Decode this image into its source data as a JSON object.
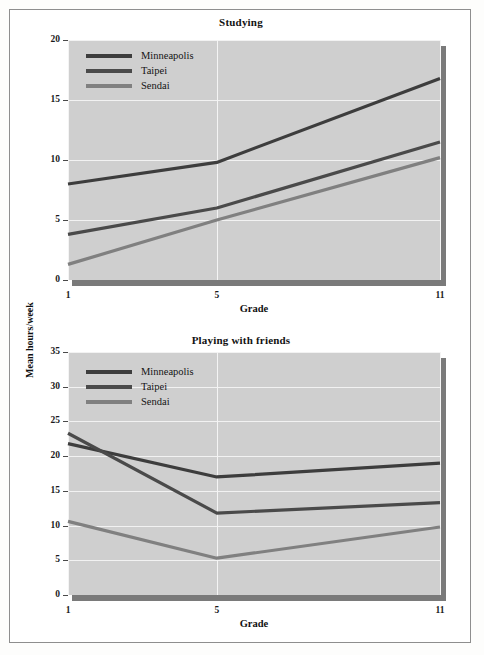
{
  "figure": {
    "background_color": "#ffffff",
    "border_color": "#8e8e8e",
    "plot_background_color": "#cfcfcf",
    "gridline_color": "#f2f2f2"
  },
  "axis_titles": {
    "y_axis_label": "Mean hours/week",
    "x_axis_label": "Grade"
  },
  "series_colors": {
    "minneapolis": "#3d3d3d",
    "taipei": "#4a4a4a",
    "sendai": "#808080"
  },
  "legend": {
    "items": [
      {
        "label": "Minneapolis",
        "color": "#3d3d3d"
      },
      {
        "label": "Taipei",
        "color": "#4a4a4a"
      },
      {
        "label": "Sendai",
        "color": "#808080"
      }
    ]
  },
  "chart_data": [
    {
      "type": "line",
      "title": "Studying",
      "xlabel": "Grade",
      "ylabel": "Mean hours/week",
      "categories": [
        "1",
        "5",
        "11"
      ],
      "x": [
        1,
        5,
        11
      ],
      "xlim": [
        1,
        11
      ],
      "ylim": [
        0,
        20
      ],
      "yticks": [
        0,
        5,
        10,
        15,
        20
      ],
      "xticks": [
        1,
        5,
        11
      ],
      "grid": true,
      "legend_position": "top-left",
      "series": [
        {
          "name": "Minneapolis",
          "color": "#3d3d3d",
          "values": [
            8.0,
            9.8,
            16.8
          ]
        },
        {
          "name": "Taipei",
          "color": "#4a4a4a",
          "values": [
            3.8,
            6.0,
            11.5
          ]
        },
        {
          "name": "Sendai",
          "color": "#808080",
          "values": [
            1.3,
            5.0,
            10.2
          ]
        }
      ]
    },
    {
      "type": "line",
      "title": "Playing with friends",
      "xlabel": "Grade",
      "ylabel": "Mean hours/week",
      "categories": [
        "1",
        "5",
        "11"
      ],
      "x": [
        1,
        5,
        11
      ],
      "xlim": [
        1,
        11
      ],
      "ylim": [
        0,
        35
      ],
      "yticks": [
        0,
        5,
        10,
        15,
        20,
        25,
        30,
        35
      ],
      "xticks": [
        1,
        5,
        11
      ],
      "grid": true,
      "legend_position": "top-left",
      "series": [
        {
          "name": "Minneapolis",
          "color": "#3d3d3d",
          "values": [
            21.8,
            17.0,
            19.0
          ]
        },
        {
          "name": "Taipei",
          "color": "#4a4a4a",
          "values": [
            23.3,
            11.8,
            13.3
          ]
        },
        {
          "name": "Sendai",
          "color": "#808080",
          "values": [
            10.6,
            5.3,
            9.8
          ]
        }
      ]
    }
  ]
}
